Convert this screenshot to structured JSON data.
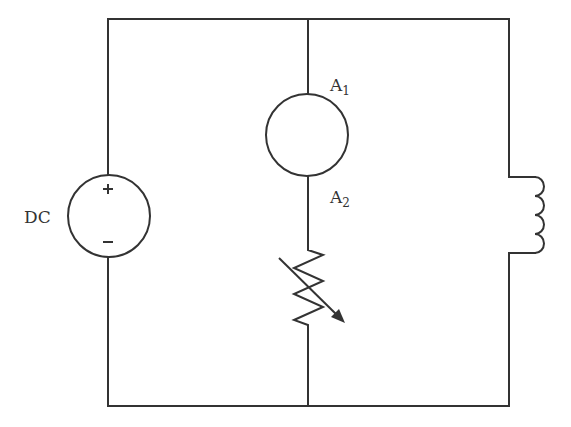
{
  "diagram": {
    "type": "circuit-schematic",
    "components": {
      "dc_source": {
        "label": "DC",
        "plus": "+",
        "minus": "–"
      },
      "ammeter": {
        "top_terminal": "A",
        "top_sub": "1",
        "bottom_terminal": "A",
        "bottom_sub": "2"
      },
      "variable_resistor": {
        "label": ""
      },
      "inductor": {
        "label": ""
      }
    },
    "colors": {
      "line": "#333333",
      "background": "#ffffff"
    }
  }
}
